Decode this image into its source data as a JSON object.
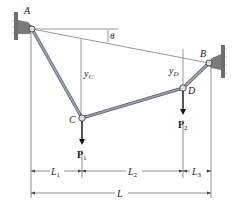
{
  "figure": {
    "points": {
      "A": {
        "label": "A"
      },
      "B": {
        "label": "B"
      },
      "C": {
        "label": "C"
      },
      "D": {
        "label": "D"
      }
    },
    "angle_label": "θ",
    "sag_labels": {
      "yC": "y",
      "yC_sub": "C",
      "yD": "y",
      "yD_sub": "D"
    },
    "loads": {
      "P1": {
        "label": "P",
        "sub": "1"
      },
      "P2": {
        "label": "P",
        "sub": "2"
      }
    },
    "dimensions": {
      "L1": {
        "label": "L",
        "sub": "1"
      },
      "L2": {
        "label": "L",
        "sub": "2"
      },
      "L3": {
        "label": "L",
        "sub": "3"
      },
      "L": {
        "label": "L"
      }
    },
    "colors": {
      "cable": "#8a96a3",
      "cable_edge": "#4f5b66",
      "wall": "#6e6e6e",
      "line": "#444444"
    }
  }
}
